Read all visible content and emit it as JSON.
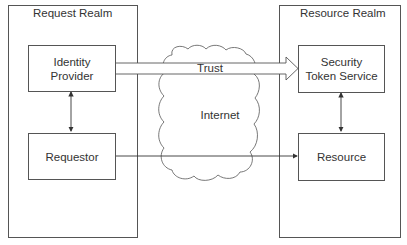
{
  "diagram": {
    "type": "architecture",
    "realms": [
      {
        "id": "request-realm",
        "title": "Request Realm"
      },
      {
        "id": "resource-realm",
        "title": "Resource Realm"
      }
    ],
    "nodes": [
      {
        "id": "identity-provider",
        "label": "Identity Provider",
        "realm": "request-realm"
      },
      {
        "id": "requestor",
        "label": "Requestor",
        "realm": "request-realm"
      },
      {
        "id": "security-token-service",
        "label": "Security Token Service",
        "realm": "resource-realm"
      },
      {
        "id": "resource",
        "label": "Resource",
        "realm": "resource-realm"
      },
      {
        "id": "internet",
        "label": "Internet",
        "shape": "cloud"
      }
    ],
    "edges": [
      {
        "from": "identity-provider",
        "to": "security-token-service",
        "label": "Trust",
        "style": "hollow-block-arrow"
      },
      {
        "from": "identity-provider",
        "to": "requestor",
        "style": "bidirectional"
      },
      {
        "from": "security-token-service",
        "to": "resource",
        "style": "bidirectional"
      },
      {
        "from": "requestor",
        "to": "resource",
        "style": "single-arrow"
      }
    ],
    "colors": {
      "stroke": "#555555",
      "text": "#333333",
      "background": "#ffffff"
    }
  },
  "labels": {
    "request_realm": "Request Realm",
    "resource_realm": "Resource Realm",
    "identity_provider_l1": "Identity",
    "identity_provider_l2": "Provider",
    "requestor": "Requestor",
    "sts_l1": "Security",
    "sts_l2": "Token Service",
    "resource": "Resource",
    "internet": "Internet",
    "trust": "Trust"
  }
}
